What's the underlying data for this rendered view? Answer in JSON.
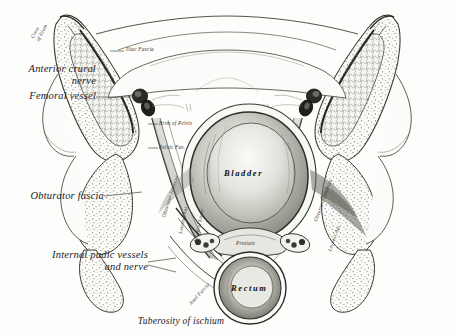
{
  "figure": {
    "width": 454,
    "height": 335,
    "background_color": "#fdfdfc",
    "ink_color": "#2b2b28"
  },
  "caption": {
    "text": "Tuberosity of ischium"
  },
  "labels": {
    "major": [
      {
        "id": "anterior-crural-nerve",
        "text": "Anterior crural\nnerve",
        "align": "right"
      },
      {
        "id": "femoral-vessel",
        "text": "Femoral vessel",
        "align": "right"
      },
      {
        "id": "obturator-fascia",
        "text": "Obturator fascia",
        "align": "right"
      },
      {
        "id": "internal-pudic-vessels-and-nerve",
        "text": "Internal pudic vessels\nand nerve",
        "align": "right"
      }
    ],
    "minor": [
      {
        "id": "crest-of-ilium",
        "text": "Crest\nof Ilium"
      },
      {
        "id": "iliac-fascia",
        "text": "Iliac Fascia"
      },
      {
        "id": "brim-of-pelvis",
        "text": "Brim of Pelvis"
      },
      {
        "id": "pelvic-fascia",
        "text": "Pelvic Fas."
      },
      {
        "id": "obturator-internus-left",
        "text": "Obturator Internus"
      },
      {
        "id": "levator-ani-left",
        "text": "Levator Ani"
      },
      {
        "id": "visceral-layer-left",
        "text": "Visceral Layer"
      },
      {
        "id": "anal-fascia-left",
        "text": "Anal Fascia"
      },
      {
        "id": "prostate",
        "text": "Prostate"
      },
      {
        "id": "obturator-internus-right",
        "text": "Obturator Internus"
      },
      {
        "id": "levator-ani-right",
        "text": "Levator Ani"
      }
    ],
    "organs": [
      {
        "id": "bladder",
        "text": "Bladder"
      },
      {
        "id": "rectum",
        "text": "Rectum"
      }
    ]
  }
}
